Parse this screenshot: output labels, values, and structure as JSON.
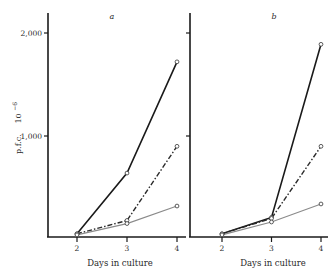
{
  "chart_data": [
    {
      "type": "line",
      "panel_label": "a",
      "title": "",
      "xlabel": "Days in culture",
      "ylabel": "p.f.c.",
      "ylabel_scale": "10",
      "ylabel_exponent": "−6",
      "x": [
        2,
        3,
        4
      ],
      "x_tick_labels": [
        "2",
        "3",
        "4"
      ],
      "y_ticks": [
        1000,
        2000
      ],
      "y_tick_labels": [
        "1,000",
        "2,000"
      ],
      "xlim": [
        1.4,
        4.15
      ],
      "ylim": [
        0,
        2200
      ],
      "grid": false,
      "legend": "none",
      "series": [
        {
          "name": "solid",
          "values": [
            50,
            640,
            1720
          ]
        },
        {
          "name": "dash-dot",
          "values": [
            50,
            180,
            900
          ]
        },
        {
          "name": "thin",
          "values": [
            40,
            150,
            320
          ]
        }
      ]
    },
    {
      "type": "line",
      "panel_label": "b",
      "title": "",
      "xlabel": "Days in culture",
      "ylabel": "",
      "x": [
        2,
        3,
        4
      ],
      "x_tick_labels": [
        "2",
        "3",
        "4"
      ],
      "y_ticks": [
        1000,
        2000
      ],
      "y_tick_labels": [
        "",
        ""
      ],
      "xlim": [
        1.35,
        4.15
      ],
      "ylim": [
        0,
        2200
      ],
      "grid": false,
      "legend": "none",
      "series": [
        {
          "name": "solid",
          "values": [
            50,
            210,
            1890
          ]
        },
        {
          "name": "dash-dot",
          "values": [
            50,
            200,
            900
          ]
        },
        {
          "name": "thin",
          "values": [
            40,
            165,
            340
          ]
        }
      ]
    }
  ]
}
